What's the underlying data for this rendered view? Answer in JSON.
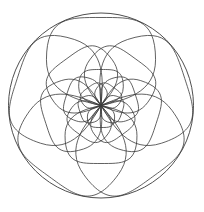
{
  "figure": {
    "kind": "geometric-rosette",
    "background_color": "#ffffff",
    "stroke_color": "#3a3a3a",
    "stroke_width": 0.8,
    "canvas": {
      "width": 204,
      "height": 212
    },
    "center": {
      "x": 101,
      "y": 105.5
    },
    "outer_circle": {
      "cx": 101,
      "cy": 105.5,
      "r": 92.5
    },
    "petal_count_per_layer": 5,
    "layer_count": 4,
    "layers": [
      {
        "name": "layer-1-outer",
        "petal_length": 88,
        "petal_width_ratio": 0.62,
        "rotation_deg": -90,
        "petal_count": 5
      },
      {
        "name": "layer-2",
        "petal_length": 58,
        "petal_width_ratio": 0.62,
        "rotation_deg": -54,
        "petal_count": 5
      },
      {
        "name": "layer-3",
        "petal_length": 36,
        "petal_width_ratio": 0.62,
        "rotation_deg": -18,
        "petal_count": 5
      },
      {
        "name": "layer-4-inner",
        "petal_length": 22,
        "petal_width_ratio": 0.62,
        "rotation_deg": 18,
        "petal_count": 5
      }
    ]
  }
}
